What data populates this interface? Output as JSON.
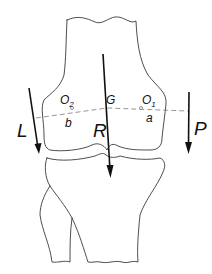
{
  "diagram": {
    "forces": [
      {
        "label": "L",
        "direction": "down",
        "side": "left"
      },
      {
        "label": "R",
        "direction": "down",
        "side": "center"
      },
      {
        "label": "P",
        "direction": "down",
        "side": "right"
      }
    ],
    "points": [
      {
        "label": "O",
        "subscript": "2"
      },
      {
        "label": "G"
      },
      {
        "label": "O",
        "subscript": "1"
      }
    ],
    "segments": [
      {
        "label": "b"
      },
      {
        "label": "a"
      }
    ],
    "colors": {
      "outline": "#3a3a3a",
      "force": "#111111",
      "axis": "#8a8a8a"
    }
  }
}
